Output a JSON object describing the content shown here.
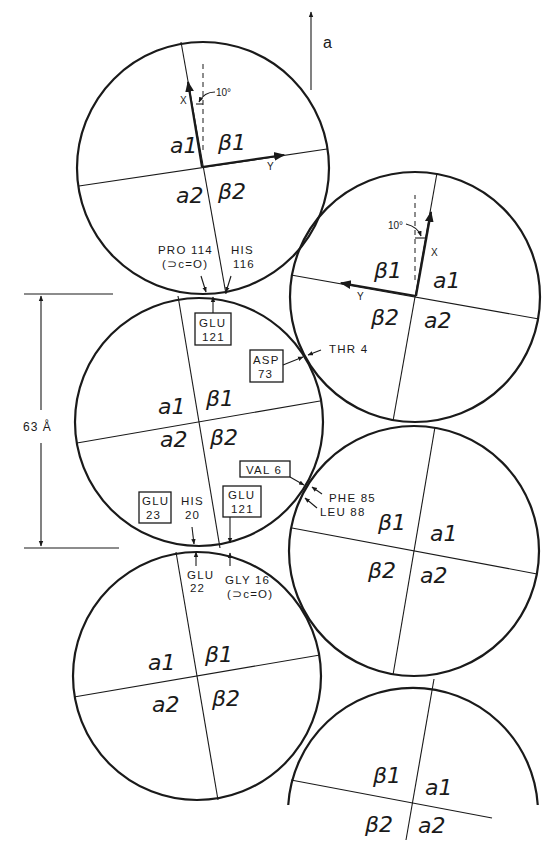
{
  "figure": {
    "crystal_axis_label": "a",
    "dimension_label": "63 Å",
    "angle_label": "10°",
    "axis_labels": {
      "x": "X",
      "y": "Y"
    }
  },
  "molecules": [
    {
      "id": "molecule-1",
      "center": [
        203,
        168
      ],
      "r": 126,
      "axis_x_end": [
        181,
        42
      ],
      "axis_y_end": [
        327,
        149
      ],
      "axis_x_neg": [
        226,
        294
      ],
      "axis_y_neg": [
        79,
        186
      ],
      "quadrants": {
        "a1": "a1",
        "b1": "β1",
        "a2": "a2",
        "b2": "β2"
      },
      "label_pos": {
        "a1": [
          170,
          153
        ],
        "b1": [
          218,
          150
        ],
        "a2": [
          176,
          203
        ],
        "b2": [
          218,
          199
        ]
      },
      "bold_axes": true,
      "orientation": "left"
    },
    {
      "id": "molecule-2",
      "center": [
        415,
        297
      ],
      "r": 125,
      "axis_x_end": [
        437,
        173
      ],
      "axis_y_end": [
        291,
        275
      ],
      "axis_x_neg": [
        393,
        421
      ],
      "axis_y_neg": [
        539,
        319
      ],
      "quadrants": {
        "a1": "a1",
        "b1": "β1",
        "a2": "a2",
        "b2": "β2"
      },
      "label_pos": {
        "a1": [
          433,
          288
        ],
        "b1": [
          374,
          278
        ],
        "a2": [
          424,
          328
        ],
        "b2": [
          371,
          325
        ]
      },
      "bold_axes": true,
      "orientation": "right"
    },
    {
      "id": "molecule-3",
      "center": [
        199,
        422
      ],
      "r": 124,
      "axis_x_end": [
        178,
        296
      ],
      "axis_y_end": [
        320,
        401
      ],
      "axis_x_neg": [
        220,
        548
      ],
      "axis_y_neg": [
        77,
        443
      ],
      "quadrants": {
        "a1": "a1",
        "b1": "β1",
        "a2": "a2",
        "b2": "β2"
      },
      "label_pos": {
        "a1": [
          158,
          414
        ],
        "b1": [
          206,
          406
        ],
        "a2": [
          160,
          447
        ],
        "b2": [
          210,
          445
        ]
      },
      "bold_axes": false,
      "orientation": "left"
    },
    {
      "id": "molecule-4",
      "center": [
        414,
        551
      ],
      "r": 125,
      "axis_x_end": [
        435,
        427
      ],
      "axis_y_end": [
        292,
        528
      ],
      "axis_x_neg": [
        393,
        675
      ],
      "axis_y_neg": [
        537,
        574
      ],
      "quadrants": {
        "a1": "a1",
        "b1": "β1",
        "a2": "a2",
        "b2": "β2"
      },
      "label_pos": {
        "a1": [
          430,
          541
        ],
        "b1": [
          378,
          530
        ],
        "a2": [
          420,
          583
        ],
        "b2": [
          368,
          578
        ]
      },
      "bold_axes": false,
      "orientation": "right"
    },
    {
      "id": "molecule-5",
      "center": [
        197,
        676
      ],
      "r": 124,
      "axis_x_end": [
        176,
        552
      ],
      "axis_y_end": [
        320,
        655
      ],
      "axis_x_neg": [
        218,
        800
      ],
      "axis_y_neg": [
        74,
        697
      ],
      "quadrants": {
        "a1": "a1",
        "b1": "β1",
        "a2": "a2",
        "b2": "β2"
      },
      "label_pos": {
        "a1": [
          148,
          670
        ],
        "b1": [
          205,
          662
        ],
        "a2": [
          152,
          712
        ],
        "b2": [
          212,
          706
        ]
      },
      "bold_axes": false,
      "orientation": "left"
    },
    {
      "id": "molecule-6",
      "center": [
        413,
        802
      ],
      "r": 125,
      "axis_x_end": [
        434,
        679
      ],
      "axis_y_end": [
        291,
        780
      ],
      "axis_x_neg": [
        406,
        840
      ],
      "axis_y_neg": [
        492,
        818
      ],
      "quadrants": {
        "a1": "a1",
        "b1": "β1",
        "a2": "a2",
        "b2": "β2"
      },
      "label_pos": {
        "a1": [
          425,
          795
        ],
        "b1": [
          373,
          783
        ],
        "a2": [
          418,
          833
        ],
        "b2": [
          365,
          832
        ]
      },
      "bold_axes": false,
      "orientation": "right",
      "partial": true
    }
  ],
  "contacts": {
    "pro114": {
      "line1": "PRO 114",
      "line2": "(⊃c=O)"
    },
    "his116": {
      "line1": "HIS",
      "line2": "116"
    },
    "glu121_top": {
      "line1": "GLU",
      "line2": "121"
    },
    "asp73": {
      "line1": "ASP",
      "line2": "73"
    },
    "thr4": {
      "line1": "THR 4"
    },
    "val6": {
      "line1": "VAL 6"
    },
    "phe85": {
      "line1": "PHE 85"
    },
    "leu88": {
      "line1": "LEU 88"
    },
    "glu23": {
      "line1": "GLU",
      "line2": "23"
    },
    "his20": {
      "line1": "HIS",
      "line2": "20"
    },
    "glu121_bottom": {
      "line1": "GLU",
      "line2": "121"
    },
    "glu22": {
      "line1": "GLU",
      "line2": "22"
    },
    "gly16": {
      "line1": "GLY 16",
      "line2": "(⊃c=O)"
    }
  }
}
